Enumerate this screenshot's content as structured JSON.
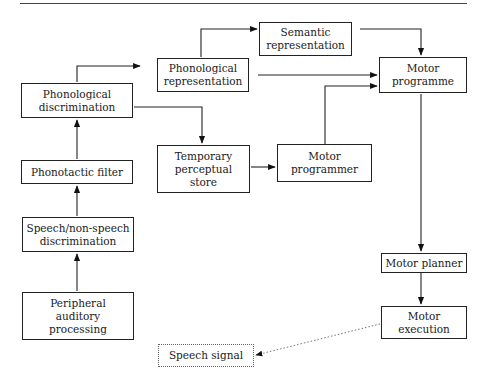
{
  "diagram": {
    "title": "",
    "nodes": [
      {
        "id": "peripheral",
        "label": "Peripheral\nauditory\nprocessing"
      },
      {
        "id": "speech_nonspeech",
        "label": "Speech/non-speech\ndiscrimination"
      },
      {
        "id": "phonotactic",
        "label": "Phonotactic filter"
      },
      {
        "id": "phon_discrim",
        "label": "Phonological\ndiscrimination"
      },
      {
        "id": "phon_rep",
        "label": "Phonological\nrepresentation"
      },
      {
        "id": "semantic_rep",
        "label": "Semantic\nrepresentation"
      },
      {
        "id": "temp_store",
        "label": "Temporary\nperceptual\nstore"
      },
      {
        "id": "motor_programmer",
        "label": "Motor\nprogrammer"
      },
      {
        "id": "motor_programme",
        "label": "Motor\nprogramme"
      },
      {
        "id": "motor_planner",
        "label": "Motor planner"
      },
      {
        "id": "motor_execution",
        "label": "Motor\nexecution"
      },
      {
        "id": "speech_signal",
        "label": "Speech signal"
      }
    ],
    "edges": [
      {
        "from": "peripheral",
        "to": "speech_nonspeech",
        "style": "solid"
      },
      {
        "from": "speech_nonspeech",
        "to": "phonotactic",
        "style": "solid"
      },
      {
        "from": "phonotactic",
        "to": "phon_discrim",
        "style": "solid"
      },
      {
        "from": "phon_discrim",
        "to": "phon_rep",
        "style": "solid"
      },
      {
        "from": "phon_discrim",
        "to": "temp_store",
        "style": "solid"
      },
      {
        "from": "phon_rep",
        "to": "semantic_rep",
        "style": "solid"
      },
      {
        "from": "phon_rep",
        "to": "motor_programme",
        "style": "solid"
      },
      {
        "from": "semantic_rep",
        "to": "motor_programme",
        "style": "solid"
      },
      {
        "from": "temp_store",
        "to": "motor_programmer",
        "style": "solid"
      },
      {
        "from": "motor_programmer",
        "to": "motor_programme",
        "style": "solid"
      },
      {
        "from": "motor_programme",
        "to": "motor_planner",
        "style": "solid"
      },
      {
        "from": "motor_planner",
        "to": "motor_execution",
        "style": "solid"
      },
      {
        "from": "motor_execution",
        "to": "speech_signal",
        "style": "dotted"
      }
    ]
  }
}
